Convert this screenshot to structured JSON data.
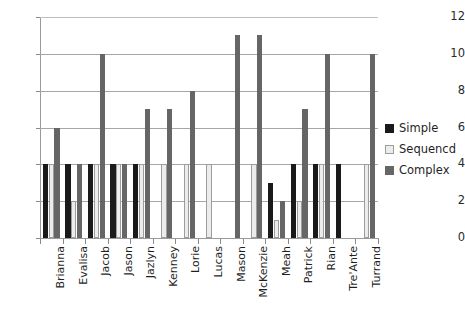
{
  "chart_data": {
    "type": "bar",
    "title": "",
    "subtitle": "",
    "xlabel": "",
    "ylabel": "",
    "ylim": [
      0,
      12
    ],
    "ytick_values": [
      0,
      2,
      4,
      6,
      8,
      10,
      12
    ],
    "ytick_labels": [
      "0",
      "2",
      "4",
      "6",
      "8",
      "10",
      "12"
    ],
    "grid": "horizontal",
    "legend_position": "right",
    "categories": [
      "Brianna",
      "Evalisa",
      "Jacob",
      "Jason",
      "Jazlyn",
      "Kenney",
      "Lorie",
      "Lucas",
      "Mason",
      "McKenzie",
      "Meah",
      "Patrick",
      "Rian",
      "Tre'Ante",
      "Turrand"
    ],
    "series": [
      {
        "name": "Simple",
        "color": "#1a1a1a",
        "values": [
          4,
          4,
          4,
          4,
          4,
          0,
          0,
          0,
          0,
          0,
          3,
          4,
          4,
          4,
          0
        ]
      },
      {
        "name": "Sequencd",
        "color": "#ececec",
        "values": [
          4,
          2,
          4,
          4,
          4,
          4,
          4,
          4,
          0,
          4,
          1,
          2,
          4,
          0,
          4
        ]
      },
      {
        "name": "Complex",
        "color": "#666666",
        "values": [
          6,
          4,
          10,
          4,
          7,
          7,
          8,
          0,
          11,
          11,
          2,
          7,
          10,
          0,
          10
        ]
      }
    ]
  },
  "legend": {
    "items": [
      {
        "label": "Simple"
      },
      {
        "label": "Sequencd"
      },
      {
        "label": "Complex"
      }
    ]
  }
}
